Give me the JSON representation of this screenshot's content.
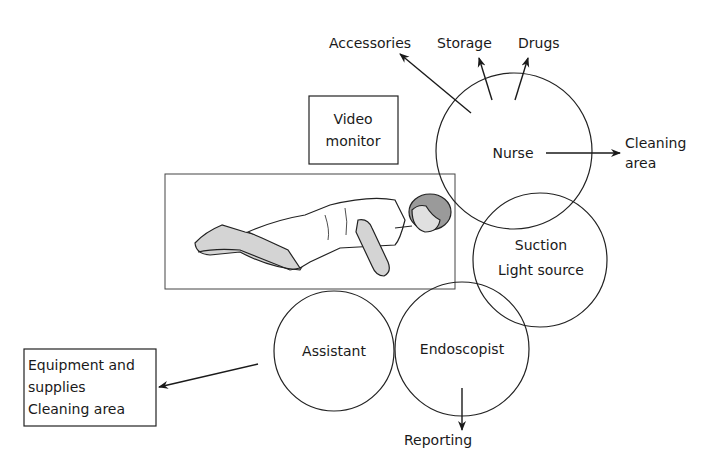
{
  "diagram": {
    "colors": {
      "line": "#2a2a2a",
      "skin": "#d4d4d4",
      "hair": "#9a9a9a"
    },
    "boxes": {
      "video_monitor": [
        "Video",
        "monitor"
      ],
      "equipment": [
        "Equipment and",
        "supplies",
        "Cleaning area"
      ]
    },
    "circles": {
      "nurse": "Nurse",
      "suction": [
        "Suction",
        "Light source"
      ],
      "assistant": "Assistant",
      "endoscopist": "Endoscopist"
    },
    "destinations": {
      "accessories": "Accessories",
      "storage": "Storage",
      "drugs": "Drugs",
      "cleaning": [
        "Cleaning",
        "area"
      ],
      "reporting": "Reporting"
    }
  }
}
